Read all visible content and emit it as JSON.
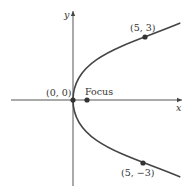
{
  "figure": {
    "type": "parabola",
    "equation_form": "horizontal, opens right",
    "axes": {
      "x_label": "x",
      "y_label": "y"
    },
    "points": [
      {
        "id": "vertex",
        "label": "(0, 0)",
        "x": 0,
        "y": 0
      },
      {
        "id": "focus",
        "label": "Focus"
      },
      {
        "id": "upper",
        "label": "(5, 3)",
        "x": 5,
        "y": 3
      },
      {
        "id": "lower",
        "label": "(5, −3)",
        "x": 5,
        "y": -3
      }
    ],
    "colors": {
      "curve": "#444444",
      "axes": "#555555",
      "points": "#333333"
    }
  }
}
